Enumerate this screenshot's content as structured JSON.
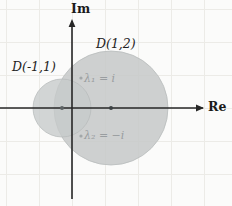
{
  "figure": {
    "background_color": "#fbfbfa",
    "axes": {
      "imaginary_axis_label": "Im",
      "real_axis_label": "Re",
      "axis_color": "#262626",
      "origin": {
        "x": 72,
        "y": 108
      }
    },
    "grid": {
      "visible": true,
      "color": "#eceae6",
      "spacing_px": 33
    },
    "discs": [
      {
        "id": "disc-large",
        "label": "D(1,2)",
        "center_real": 1,
        "radius": 2,
        "pixel_center": {
          "x": 111,
          "y": 108
        },
        "pixel_radius": 57,
        "fill_color": "#c9cbcb"
      },
      {
        "id": "disc-small",
        "label": "D(-1,1)",
        "center_real": -1,
        "radius": 1,
        "pixel_center": {
          "x": 62,
          "y": 108
        },
        "pixel_radius": 29,
        "fill_color": "#c9cbcb"
      }
    ],
    "eigenvalues": [
      {
        "id": "eigenvalue-1",
        "label": "λ₁ = i",
        "value": "i",
        "marker_color": "#9aa0a2"
      },
      {
        "id": "eigenvalue-2",
        "label": "λ₂ = −i",
        "value": "-i",
        "marker_color": "#9aa0a2"
      }
    ],
    "center_markers": [
      {
        "id": "center-marker-small",
        "x": 62,
        "y": 108
      },
      {
        "id": "center-marker-large",
        "x": 111,
        "y": 108
      }
    ]
  }
}
